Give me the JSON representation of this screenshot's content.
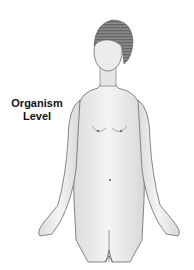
{
  "diagram": {
    "label_line1": "Organism",
    "label_line2": "Level",
    "colors": {
      "background": "#ffffff",
      "skin": "#ececec",
      "outline": "#6a6a6a",
      "hair": "#7a7a7a",
      "label": "#111111"
    }
  }
}
